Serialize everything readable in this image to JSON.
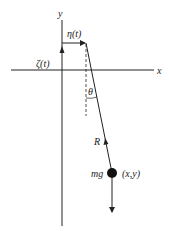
{
  "diagram": {
    "labels": {
      "y_axis": "y",
      "x_axis": "x",
      "eta": "η(t)",
      "zeta": "ζ(t)",
      "theta": "θ",
      "tension": "R",
      "weight": "mg",
      "position": "(x,y)"
    },
    "colors": {
      "line": "#222222",
      "background": "#ffffff"
    }
  }
}
